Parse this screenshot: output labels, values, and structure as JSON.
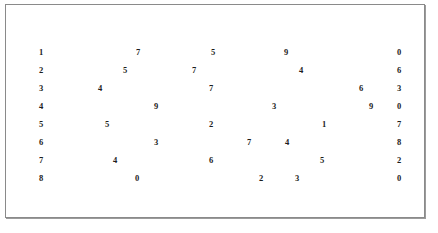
{
  "figure": {
    "border_color": "#8a8a8a",
    "shadow_color": "#9b9b9b",
    "background_color": "#ffffff",
    "text_color": "#1c1c1c"
  },
  "chart_data": {
    "type": "table",
    "title": "",
    "xlabel": "",
    "ylabel": "",
    "grid": false,
    "legend": null,
    "row_count": 8,
    "column_count": 5,
    "columns": [
      "c1",
      "c2",
      "c3",
      "c4",
      "c5"
    ],
    "rows": [
      {
        "index": 1,
        "values": [
          "1",
          "7",
          "5",
          "9",
          "0"
        ]
      },
      {
        "index": 2,
        "values": [
          "2",
          "5",
          "7",
          "4",
          "6"
        ]
      },
      {
        "index": 3,
        "values": [
          "3",
          "4",
          "7",
          "6",
          "3"
        ]
      },
      {
        "index": 4,
        "values": [
          "4",
          "9",
          "3",
          "9",
          "0"
        ]
      },
      {
        "index": 5,
        "values": [
          "5",
          "5",
          "2",
          "1",
          "7"
        ]
      },
      {
        "index": 6,
        "values": [
          "6",
          "3",
          "7",
          "4",
          "8"
        ]
      },
      {
        "index": 7,
        "values": [
          "7",
          "4",
          "6",
          "5",
          "2"
        ]
      },
      {
        "index": 8,
        "values": [
          "8",
          "0",
          "2",
          "3",
          "0"
        ]
      }
    ],
    "first_column": [
      "1",
      "2",
      "3",
      "4",
      "5",
      "6",
      "7",
      "8"
    ],
    "last_column": [
      "0",
      "6",
      "3",
      "0",
      "7",
      "8",
      "2",
      "0"
    ]
  },
  "layout": {
    "row_tops": [
      38,
      56,
      74,
      92,
      110,
      128,
      146,
      164
    ],
    "cell_lefts": [
      [
        33,
        130,
        205,
        278,
        391
      ],
      [
        33,
        117,
        186,
        293,
        391
      ],
      [
        33,
        92,
        203,
        353,
        391
      ],
      [
        33,
        148,
        266,
        363,
        391
      ],
      [
        33,
        99,
        203,
        316,
        391
      ],
      [
        33,
        148,
        241,
        279,
        391
      ],
      [
        33,
        107,
        203,
        314,
        391
      ],
      [
        33,
        129,
        253,
        289,
        391
      ]
    ]
  }
}
